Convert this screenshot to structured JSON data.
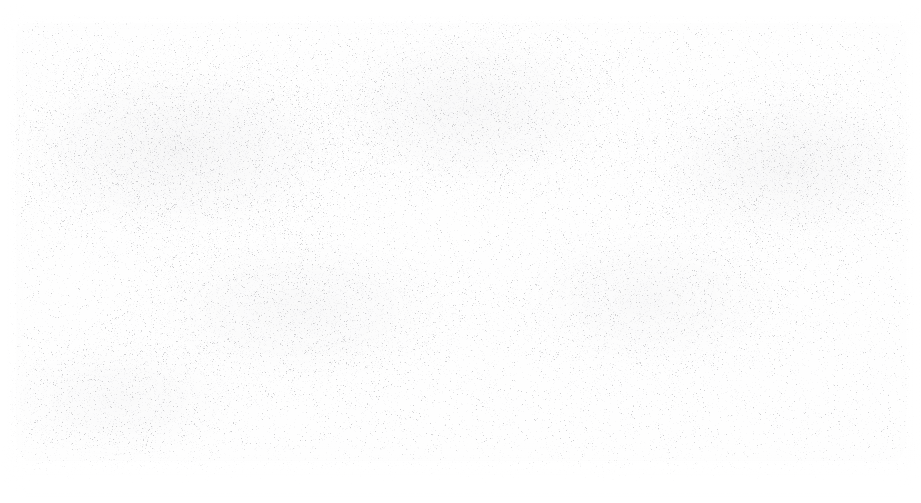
{
  "page": {
    "kind": "blank-scanned-page",
    "width": 921,
    "height": 503,
    "text_content": "",
    "visible_text_elements": [],
    "background_color": "#fefefe",
    "paper_color": "#ffffff"
  },
  "surface": {
    "description": "blank white scanned page with fine scanner speckle noise",
    "noise": {
      "base_density": 0.16,
      "speckle_color_light": "#d8d8dc",
      "speckle_color_dark": "#a8a8ac",
      "seed": 20240917
    },
    "margins": {
      "top": 18,
      "left": 12,
      "right": 10,
      "bottom": 40
    },
    "density_regions": [
      {
        "cx": 180,
        "cy": 150,
        "rx": 230,
        "ry": 120,
        "weight": 1.0
      },
      {
        "cx": 470,
        "cy": 110,
        "rx": 200,
        "ry": 110,
        "weight": 0.85
      },
      {
        "cx": 790,
        "cy": 165,
        "rx": 190,
        "ry": 105,
        "weight": 0.92
      },
      {
        "cx": 300,
        "cy": 310,
        "rx": 210,
        "ry": 100,
        "weight": 0.7
      },
      {
        "cx": 650,
        "cy": 300,
        "rx": 180,
        "ry": 95,
        "weight": 0.62
      },
      {
        "cx": 120,
        "cy": 400,
        "rx": 160,
        "ry": 80,
        "weight": 0.55
      }
    ]
  }
}
